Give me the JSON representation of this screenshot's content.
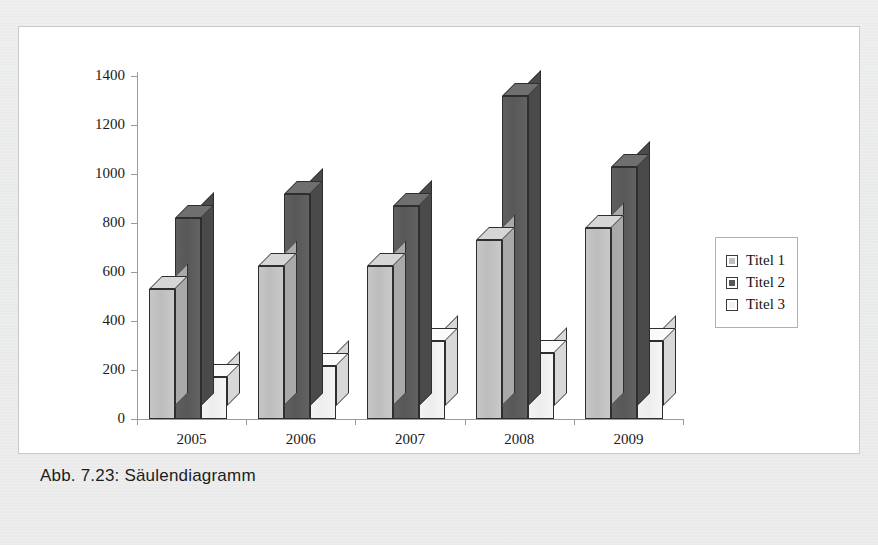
{
  "caption": "Abb. 7.23: Säulendiagramm",
  "colors": {
    "page_background": "#e9eaea",
    "panel_background": "#ffffff",
    "panel_border": "#c9c9c9",
    "axis": "#9a9a9a",
    "series1": "#bfbfbf",
    "series2": "#595959",
    "series3": "#f0f0f0",
    "bar_outline": "#2e2e2e",
    "text": "#1a1a1a"
  },
  "legend": {
    "position": "right",
    "items": [
      {
        "label": "Titel 1",
        "swatch": "series1-swatch"
      },
      {
        "label": "Titel 2",
        "swatch": "series2-swatch"
      },
      {
        "label": "Titel 3",
        "swatch": "series3-swatch"
      }
    ]
  },
  "axis": {
    "y_ticks": [
      "1400",
      "1200",
      "1000",
      "800",
      "600",
      "400",
      "200",
      "0"
    ],
    "x_ticks": [
      "2005",
      "2006",
      "2007",
      "2008",
      "2009"
    ]
  },
  "chart_data": {
    "type": "bar",
    "title": "Abb. 7.23: Säulendiagramm",
    "xlabel": "",
    "ylabel": "",
    "ylim": [
      0,
      1400
    ],
    "ytick_step": 200,
    "grid": false,
    "legend_position": "right",
    "three_d": true,
    "categories": [
      "2005",
      "2006",
      "2007",
      "2008",
      "2009"
    ],
    "series": [
      {
        "name": "Titel 1",
        "values": [
          530,
          625,
          625,
          730,
          780
        ]
      },
      {
        "name": "Titel 2",
        "values": [
          820,
          920,
          870,
          1320,
          1030
        ]
      },
      {
        "name": "Titel 3",
        "values": [
          170,
          215,
          320,
          270,
          320
        ]
      }
    ]
  }
}
